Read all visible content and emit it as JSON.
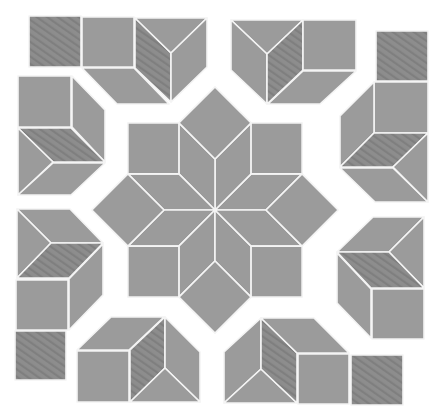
{
  "colors": {
    "background": "#ffffff",
    "plain_fill": "#9b9b9b",
    "hatched_fill": "#8d8d8d",
    "stripe": "#7f7f7f",
    "seam": "#f4f4f4"
  },
  "star": {
    "center": [
      215,
      210
    ],
    "edge": 51,
    "rhombus_count": 8,
    "square_count": 8
  },
  "clusters": [
    {
      "name": "top-left",
      "pieces": [
        {
          "type": "square",
          "hatched": true,
          "pts": [
            [
              29,
              16
            ],
            [
              81,
              16
            ],
            [
              81,
              67
            ],
            [
              29,
              67
            ]
          ]
        },
        {
          "type": "square",
          "hatched": false,
          "pts": [
            [
              82,
              17
            ],
            [
              134,
              17
            ],
            [
              134,
              67
            ],
            [
              82,
              67
            ]
          ]
        },
        {
          "type": "parallelogram",
          "hatched": false,
          "pts": [
            [
              82,
              68
            ],
            [
              134,
              68
            ],
            [
              169,
              104
            ],
            [
              117,
              104
            ]
          ]
        },
        {
          "type": "rhombus",
          "hatched": true,
          "pts": [
            [
              135,
              18
            ],
            [
              171,
              53
            ],
            [
              171,
              102
            ],
            [
              135,
              68
            ]
          ]
        },
        {
          "type": "triangle",
          "hatched": false,
          "pts": [
            [
              135,
              18
            ],
            [
              207,
              18
            ],
            [
              171,
              53
            ]
          ]
        },
        {
          "type": "parallelogram",
          "hatched": false,
          "pts": [
            [
              171,
              53
            ],
            [
              207,
              18
            ],
            [
              207,
              67
            ],
            [
              171,
              102
            ]
          ]
        }
      ]
    },
    {
      "name": "top-right",
      "pieces": [
        {
          "type": "triangle",
          "hatched": false,
          "pts": [
            [
              231,
              20
            ],
            [
              303,
              20
            ],
            [
              267,
              54
            ]
          ]
        },
        {
          "type": "parallelogram",
          "hatched": false,
          "pts": [
            [
              231,
              20
            ],
            [
              267,
              54
            ],
            [
              267,
              104
            ],
            [
              231,
              70
            ]
          ]
        },
        {
          "type": "rhombus",
          "hatched": true,
          "pts": [
            [
              267,
              54
            ],
            [
              303,
              20
            ],
            [
              303,
              70
            ],
            [
              267,
              104
            ]
          ]
        },
        {
          "type": "square",
          "hatched": false,
          "pts": [
            [
              303,
              20
            ],
            [
              356,
              20
            ],
            [
              356,
              70
            ],
            [
              303,
              70
            ]
          ]
        },
        {
          "type": "parallelogram",
          "hatched": false,
          "pts": [
            [
              303,
              71
            ],
            [
              356,
              71
            ],
            [
              320,
              104
            ],
            [
              268,
              104
            ]
          ]
        }
      ]
    },
    {
      "name": "right-upper",
      "pieces": [
        {
          "type": "square",
          "hatched": true,
          "pts": [
            [
              376,
              31
            ],
            [
              428,
              31
            ],
            [
              428,
              81
            ],
            [
              376,
              81
            ]
          ]
        },
        {
          "type": "square",
          "hatched": false,
          "pts": [
            [
              374,
              82
            ],
            [
              428,
              82
            ],
            [
              428,
              133
            ],
            [
              374,
              133
            ]
          ]
        },
        {
          "type": "parallelogram",
          "hatched": false,
          "pts": [
            [
              340,
              116
            ],
            [
              374,
              82
            ],
            [
              374,
              133
            ],
            [
              340,
              167
            ]
          ]
        },
        {
          "type": "rhombus",
          "hatched": true,
          "pts": [
            [
              340,
              167
            ],
            [
              374,
              133
            ],
            [
              428,
              133
            ],
            [
              393,
              167
            ]
          ]
        },
        {
          "type": "parallelogram",
          "hatched": false,
          "pts": [
            [
              340,
              168
            ],
            [
              393,
              168
            ],
            [
              428,
              202
            ],
            [
              375,
              202
            ]
          ]
        },
        {
          "type": "triangle",
          "hatched": false,
          "pts": [
            [
              393,
              167
            ],
            [
              428,
              133
            ],
            [
              428,
              202
            ]
          ]
        }
      ]
    },
    {
      "name": "right-lower",
      "pieces": [
        {
          "type": "parallelogram",
          "hatched": false,
          "pts": [
            [
              373,
              217
            ],
            [
              424,
              217
            ],
            [
              389,
              252
            ],
            [
              337,
              252
            ]
          ]
        },
        {
          "type": "triangle",
          "hatched": false,
          "pts": [
            [
              389,
              252
            ],
            [
              424,
              217
            ],
            [
              424,
              288
            ]
          ]
        },
        {
          "type": "rhombus",
          "hatched": true,
          "pts": [
            [
              337,
              252
            ],
            [
              389,
              252
            ],
            [
              424,
              288
            ],
            [
              371,
              288
            ]
          ]
        },
        {
          "type": "parallelogram",
          "hatched": false,
          "pts": [
            [
              337,
              253
            ],
            [
              371,
              289
            ],
            [
              371,
              338
            ],
            [
              337,
              303
            ]
          ]
        },
        {
          "type": "square",
          "hatched": false,
          "pts": [
            [
              372,
              289
            ],
            [
              424,
              289
            ],
            [
              424,
              339
            ],
            [
              372,
              339
            ]
          ]
        }
      ]
    },
    {
      "name": "bottom-right",
      "pieces": [
        {
          "type": "parallelogram",
          "hatched": false,
          "pts": [
            [
              224,
              352
            ],
            [
              261,
              318
            ],
            [
              261,
              369
            ],
            [
              224,
              403
            ]
          ]
        },
        {
          "type": "triangle",
          "hatched": false,
          "pts": [
            [
              224,
              403
            ],
            [
              261,
              369
            ],
            [
              297,
              403
            ]
          ]
        },
        {
          "type": "rhombus",
          "hatched": true,
          "pts": [
            [
              261,
              318
            ],
            [
              297,
              353
            ],
            [
              297,
              403
            ],
            [
              261,
              369
            ]
          ]
        },
        {
          "type": "parallelogram",
          "hatched": false,
          "pts": [
            [
              261,
              318
            ],
            [
              314,
              318
            ],
            [
              349,
              353
            ],
            [
              297,
              353
            ]
          ]
        },
        {
          "type": "square",
          "hatched": false,
          "pts": [
            [
              298,
              354
            ],
            [
              349,
              354
            ],
            [
              349,
              404
            ],
            [
              298,
              404
            ]
          ]
        },
        {
          "type": "square",
          "hatched": true,
          "pts": [
            [
              351,
              355
            ],
            [
              403,
              355
            ],
            [
              403,
              405
            ],
            [
              351,
              405
            ]
          ]
        }
      ]
    },
    {
      "name": "bottom-left",
      "pieces": [
        {
          "type": "parallelogram",
          "hatched": false,
          "pts": [
            [
              111,
              317
            ],
            [
              164,
              317
            ],
            [
              129,
              350
            ],
            [
              77,
              350
            ]
          ]
        },
        {
          "type": "square",
          "hatched": false,
          "pts": [
            [
              77,
              351
            ],
            [
              129,
              351
            ],
            [
              129,
              402
            ],
            [
              77,
              402
            ]
          ]
        },
        {
          "type": "rhombus",
          "hatched": true,
          "pts": [
            [
              130,
              350
            ],
            [
              165,
              317
            ],
            [
              165,
              368
            ],
            [
              130,
              402
            ]
          ]
        },
        {
          "type": "parallelogram",
          "hatched": false,
          "pts": [
            [
              165,
              317
            ],
            [
              200,
              352
            ],
            [
              200,
              402
            ],
            [
              165,
              368
            ]
          ]
        },
        {
          "type": "triangle",
          "hatched": false,
          "pts": [
            [
              130,
              402
            ],
            [
              165,
              368
            ],
            [
              200,
              402
            ]
          ]
        }
      ]
    },
    {
      "name": "left-lower",
      "pieces": [
        {
          "type": "parallelogram",
          "hatched": false,
          "pts": [
            [
              17,
              209
            ],
            [
              70,
              209
            ],
            [
              103,
              243
            ],
            [
              51,
              243
            ]
          ]
        },
        {
          "type": "triangle",
          "hatched": false,
          "pts": [
            [
              17,
              209
            ],
            [
              51,
              243
            ],
            [
              17,
              278
            ]
          ]
        },
        {
          "type": "rhombus",
          "hatched": true,
          "pts": [
            [
              17,
              278
            ],
            [
              51,
              243
            ],
            [
              103,
              243
            ],
            [
              69,
              278
            ]
          ]
        },
        {
          "type": "square",
          "hatched": false,
          "pts": [
            [
              16,
              280
            ],
            [
              68,
              280
            ],
            [
              68,
              330
            ],
            [
              16,
              330
            ]
          ]
        },
        {
          "type": "parallelogram",
          "hatched": false,
          "pts": [
            [
              69,
              279
            ],
            [
              103,
              244
            ],
            [
              103,
              295
            ],
            [
              69,
              330
            ]
          ]
        },
        {
          "type": "square",
          "hatched": true,
          "pts": [
            [
              15,
              331
            ],
            [
              66,
              331
            ],
            [
              66,
              380
            ],
            [
              15,
              380
            ]
          ]
        }
      ]
    },
    {
      "name": "left-upper",
      "pieces": [
        {
          "type": "square",
          "hatched": false,
          "pts": [
            [
              18,
              76
            ],
            [
              71,
              76
            ],
            [
              71,
              127
            ],
            [
              18,
              127
            ]
          ]
        },
        {
          "type": "parallelogram",
          "hatched": false,
          "pts": [
            [
              72,
              76
            ],
            [
              105,
              110
            ],
            [
              105,
              162
            ],
            [
              72,
              127
            ]
          ]
        },
        {
          "type": "rhombus",
          "hatched": true,
          "pts": [
            [
              18,
              128
            ],
            [
              71,
              128
            ],
            [
              105,
              162
            ],
            [
              53,
              162
            ]
          ]
        },
        {
          "type": "triangle",
          "hatched": false,
          "pts": [
            [
              18,
              128
            ],
            [
              53,
              162
            ],
            [
              18,
              195
            ]
          ]
        },
        {
          "type": "parallelogram",
          "hatched": false,
          "pts": [
            [
              18,
              195
            ],
            [
              53,
              163
            ],
            [
              105,
              163
            ],
            [
              71,
              195
            ]
          ]
        }
      ]
    }
  ]
}
